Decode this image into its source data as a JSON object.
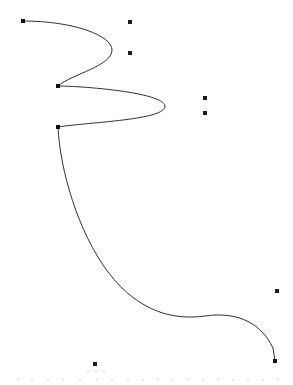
{
  "canvas": {
    "width": 293,
    "height": 385,
    "background_color": "#ffffff",
    "title": ""
  },
  "style": {
    "stroke_color": "#1a1a1a",
    "stroke_width": 0.9,
    "node_marker_color": "#111111",
    "scatter_marker_color": "#1c1c1c",
    "node_marker_size": 4,
    "scatter_marker_size": 4,
    "speck_color": "#e9e9e9"
  },
  "chart_data": {
    "type": "scatter",
    "title": "",
    "xlabel": "",
    "ylabel": "",
    "xlim": [
      0,
      293
    ],
    "ylim": [
      0,
      385
    ],
    "grid": false,
    "legend": "none",
    "series": [
      {
        "name": "spline-curve",
        "kind": "bezier-path",
        "path": "M 23 21 C 75 21 112 36 112 50 C 112 66 72 74 58 86 C 80 86 163 92 165 106 C 166 120 90 122 58 127 C 60 170 78 232 108 272 C 140 314 176 320 205 316 C 240 311 262 325 273 348 L 275 361",
        "anchor_points": [
          {
            "name": "start-node",
            "x": 23,
            "y": 21
          },
          {
            "name": "cusp-node-upper",
            "x": 58,
            "y": 86
          },
          {
            "name": "cusp-node-lower",
            "x": 58,
            "y": 127
          },
          {
            "name": "end-node",
            "x": 275,
            "y": 361
          }
        ],
        "extrema": [
          {
            "name": "loop-1-right-extreme",
            "x": 112,
            "y": 50
          },
          {
            "name": "loop-2-right-extreme",
            "x": 165,
            "y": 106
          },
          {
            "name": "descent-inflection",
            "x": 205,
            "y": 316
          }
        ]
      },
      {
        "name": "scatter-points",
        "kind": "points",
        "x": [
          130,
          130,
          205,
          205,
          277,
          95
        ],
        "y": [
          22,
          53,
          98,
          113,
          291,
          364
        ]
      }
    ]
  },
  "nodes": [
    {
      "label": "start-node",
      "x": 23,
      "y": 21
    },
    {
      "label": "cusp-node-upper",
      "x": 58,
      "y": 86
    },
    {
      "label": "cusp-node-lower",
      "x": 58,
      "y": 127
    },
    {
      "label": "end-node",
      "x": 275,
      "y": 361
    }
  ],
  "scatter": [
    {
      "label": "scatter-point-1",
      "x": 130,
      "y": 22
    },
    {
      "label": "scatter-point-2",
      "x": 130,
      "y": 53
    },
    {
      "label": "scatter-point-3",
      "x": 205,
      "y": 98
    },
    {
      "label": "scatter-point-4",
      "x": 205,
      "y": 113
    },
    {
      "label": "scatter-point-5",
      "x": 277,
      "y": 291
    },
    {
      "label": "scatter-point-6",
      "x": 95,
      "y": 364
    }
  ],
  "baseline_specks": [
    {
      "x": 18,
      "y": 379
    },
    {
      "x": 32,
      "y": 379
    },
    {
      "x": 48,
      "y": 380
    },
    {
      "x": 63,
      "y": 379
    },
    {
      "x": 80,
      "y": 380
    },
    {
      "x": 97,
      "y": 379
    },
    {
      "x": 112,
      "y": 380
    },
    {
      "x": 128,
      "y": 379
    },
    {
      "x": 143,
      "y": 380
    },
    {
      "x": 158,
      "y": 379
    },
    {
      "x": 172,
      "y": 380
    },
    {
      "x": 188,
      "y": 379
    },
    {
      "x": 203,
      "y": 380
    },
    {
      "x": 218,
      "y": 379
    },
    {
      "x": 233,
      "y": 380
    },
    {
      "x": 248,
      "y": 379
    },
    {
      "x": 263,
      "y": 380
    },
    {
      "x": 278,
      "y": 379
    },
    {
      "x": 88,
      "y": 371
    },
    {
      "x": 96,
      "y": 371
    },
    {
      "x": 104,
      "y": 371
    }
  ]
}
